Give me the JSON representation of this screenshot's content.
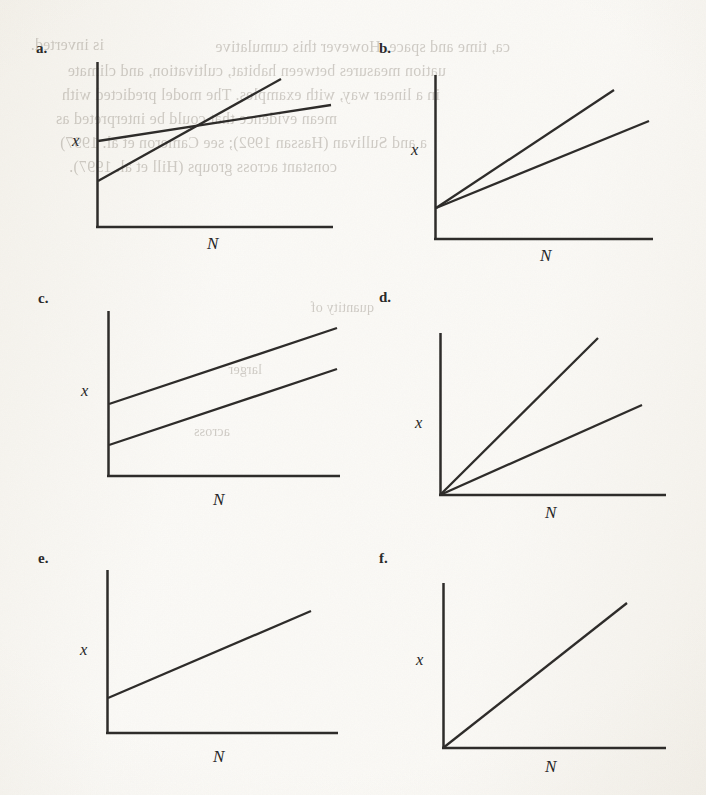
{
  "figure": {
    "background_color": "#fbfaf7",
    "ink_color": "#2e2c2a",
    "panel_count": 6,
    "axis_labels": {
      "x": "x",
      "y_vertical": "x",
      "horizontal": "N"
    }
  },
  "panels": [
    {
      "letter": "a.",
      "name": "panel-a",
      "description": "Two lines with different intercepts and different slopes that cross",
      "x_axis_label": "N",
      "y_axis_label": "x",
      "line_count": 2
    },
    {
      "letter": "b.",
      "name": "panel-b",
      "description": "Two lines from the same positive intercept with different slopes",
      "x_axis_label": "N",
      "y_axis_label": "x",
      "line_count": 2
    },
    {
      "letter": "c.",
      "name": "panel-c",
      "description": "Two parallel lines with different positive intercepts",
      "x_axis_label": "N",
      "y_axis_label": "x",
      "line_count": 2
    },
    {
      "letter": "d.",
      "name": "panel-d",
      "description": "Two lines from the origin with different slopes",
      "x_axis_label": "N",
      "y_axis_label": "x",
      "line_count": 2
    },
    {
      "letter": "e.",
      "name": "panel-e",
      "description": "Single line with a positive intercept and shallow slope",
      "x_axis_label": "N",
      "y_axis_label": "x",
      "line_count": 1
    },
    {
      "letter": "f.",
      "name": "panel-f",
      "description": "Single line from the origin with steep slope",
      "x_axis_label": "N",
      "y_axis_label": "x",
      "line_count": 1
    }
  ],
  "chart_data": [
    {
      "type": "line",
      "panel": "a",
      "title": "a.",
      "xlabel": "N",
      "ylabel": "x",
      "xlim": [
        0,
        100
      ],
      "ylim": [
        0,
        100
      ],
      "grid": false,
      "legend": "none",
      "axes_style": "two-spine",
      "series": [
        {
          "name": "line-1-flat",
          "intercept": 52,
          "slope": 0.31,
          "x": [
            0,
            100
          ],
          "values": [
            52,
            83
          ]
        },
        {
          "name": "line-2-steep",
          "intercept": 28,
          "slope": 0.77,
          "x": [
            0,
            78
          ],
          "values": [
            28,
            88
          ]
        }
      ],
      "note": "Lines intersect at approximately N = 52"
    },
    {
      "type": "line",
      "panel": "b",
      "title": "b.",
      "xlabel": "N",
      "ylabel": "x",
      "xlim": [
        0,
        100
      ],
      "ylim": [
        0,
        100
      ],
      "grid": false,
      "legend": "none",
      "axes_style": "two-spine",
      "series": [
        {
          "name": "line-1-steep",
          "intercept": 19,
          "slope": 0.69,
          "x": [
            0,
            83
          ],
          "values": [
            19,
            76
          ]
        },
        {
          "name": "line-2-shallow",
          "intercept": 19,
          "slope": 0.45,
          "x": [
            0,
            100
          ],
          "values": [
            19,
            64
          ]
        }
      ],
      "note": "Both lines share the same positive intercept"
    },
    {
      "type": "line",
      "panel": "c",
      "title": "c.",
      "xlabel": "N",
      "ylabel": "x",
      "xlim": [
        0,
        100
      ],
      "ylim": [
        0,
        100
      ],
      "grid": false,
      "legend": "none",
      "axes_style": "two-spine",
      "series": [
        {
          "name": "line-1-upper",
          "intercept": 44,
          "slope": 0.34,
          "x": [
            0,
            100
          ],
          "values": [
            44,
            78
          ]
        },
        {
          "name": "line-2-lower",
          "intercept": 19,
          "slope": 0.34,
          "x": [
            0,
            100
          ],
          "values": [
            19,
            53
          ]
        }
      ],
      "note": "Lines are parallel (equal slopes), different intercepts"
    },
    {
      "type": "line",
      "panel": "d",
      "title": "d.",
      "xlabel": "N",
      "ylabel": "x",
      "xlim": [
        0,
        100
      ],
      "ylim": [
        0,
        100
      ],
      "grid": false,
      "legend": "none",
      "axes_style": "two-spine",
      "series": [
        {
          "name": "line-1-steep",
          "intercept": 0,
          "slope": 0.95,
          "x": [
            0,
            76
          ],
          "values": [
            0,
            72
          ]
        },
        {
          "name": "line-2-shallow",
          "intercept": 0,
          "slope": 0.45,
          "x": [
            0,
            100
          ],
          "values": [
            0,
            45
          ]
        }
      ],
      "note": "Both lines pass through the origin"
    },
    {
      "type": "line",
      "panel": "e",
      "title": "e.",
      "xlabel": "N",
      "ylabel": "x",
      "xlim": [
        0,
        100
      ],
      "ylim": [
        0,
        100
      ],
      "grid": false,
      "legend": "none",
      "axes_style": "two-spine",
      "series": [
        {
          "name": "line-1",
          "intercept": 22,
          "slope": 0.44,
          "x": [
            0,
            93
          ],
          "values": [
            22,
            63
          ]
        }
      ],
      "note": "Single line with positive intercept"
    },
    {
      "type": "line",
      "panel": "f",
      "title": "f.",
      "xlabel": "N",
      "ylabel": "x",
      "xlim": [
        0,
        100
      ],
      "ylim": [
        0,
        100
      ],
      "grid": false,
      "legend": "none",
      "axes_style": "two-spine",
      "series": [
        {
          "name": "line-1",
          "intercept": 0,
          "slope": 0.88,
          "x": [
            0,
            92
          ],
          "values": [
            0,
            81
          ]
        }
      ],
      "note": "Single line through the origin"
    }
  ],
  "show_through_text": {
    "description": "Faint mirrored text bleeding through from the reverse side of the scanned page",
    "lines": [
      {
        "text": "is inverted.",
        "top": 36,
        "left": 12,
        "size": 16
      },
      {
        "text": "ca, time and space. However this cumulative",
        "top": 38,
        "left": 180,
        "size": 16
      },
      {
        "text": "uation measures between habitat, cultivation, and climate",
        "top": 62,
        "left": 8,
        "size": 16
      },
      {
        "text": "in a linear way, with examples. The model predicted with",
        "top": 86,
        "left": 10,
        "size": 16
      },
      {
        "text": "mean evidence that could be interpreted as",
        "top": 110,
        "left": 14,
        "size": 16
      },
      {
        "text": "a and Sullivan (Hassan 1992); see Cameron et al. 1997)",
        "top": 134,
        "left": 12,
        "size": 16
      },
      {
        "text": "constant across groups (Hill et al. 1997).",
        "top": 158,
        "left": 14,
        "size": 16
      },
      {
        "text": "quantity of",
        "top": 300,
        "left": 300,
        "size": 14
      },
      {
        "text": "larger",
        "top": 362,
        "left": 222,
        "size": 14
      },
      {
        "text": "across",
        "top": 424,
        "left": 190,
        "size": 14
      }
    ]
  }
}
